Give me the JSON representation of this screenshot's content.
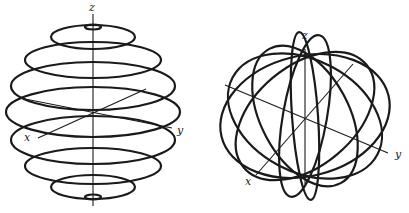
{
  "figures": [
    {
      "id": "left",
      "description": "Sphere drawn as stacked latitude circles",
      "axis_labels": {
        "x": "x",
        "y": "y",
        "z": "z"
      }
    },
    {
      "id": "right",
      "description": "Sphere drawn as great-circle meridians through the poles",
      "axis_labels": {
        "x": "x",
        "y": "y",
        "z": "z"
      }
    }
  ],
  "colors": {
    "stroke": "#1a1a1a",
    "background": "#ffffff"
  }
}
